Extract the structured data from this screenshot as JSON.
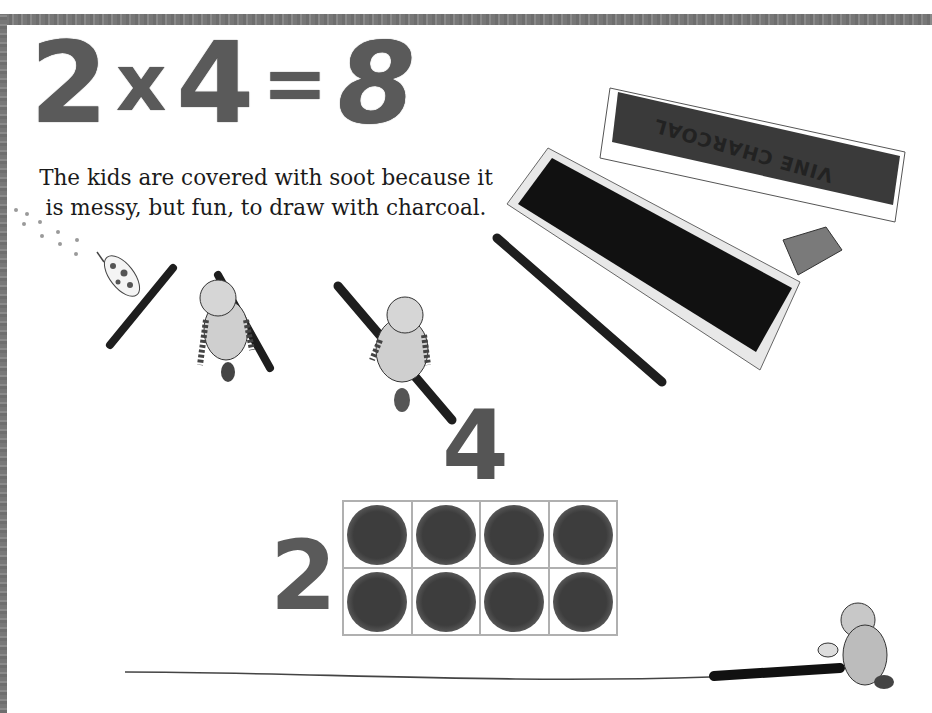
{
  "page": {
    "equation": {
      "factor_a": "2",
      "operator": "x",
      "factor_b": "4",
      "equals": "=",
      "product": "8"
    },
    "caption": "The kids are covered with soot because it is messy, but fun, to draw with charcoal.",
    "charcoal_box_label": "VINE CHARCOAL",
    "array_model": {
      "rows_label": "2",
      "columns_label": "4",
      "rows": 2,
      "columns": 4,
      "filled_cells": 8
    },
    "colors": {
      "border": "#777777",
      "numerals": "#5a5a5a",
      "charcoal": "#1e1e1e",
      "grid_line": "#b0b0b0",
      "text": "#1a1a1a"
    }
  }
}
